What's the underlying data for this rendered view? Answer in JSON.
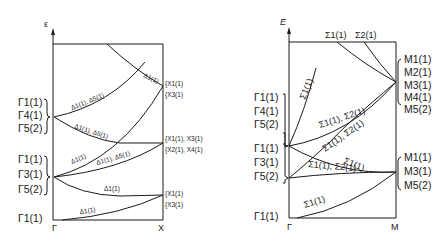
{
  "left_panel": {
    "axis_label": "ε",
    "x_start_label": "Γ",
    "x_end_label": "X",
    "gamma_groups": [
      [
        "Γ1(1)",
        "Γ4(1)",
        "Γ5(2)"
      ],
      [
        "Γ1(1)",
        "Γ3(1)",
        "Γ5(2)"
      ],
      [
        "Γ1(1)"
      ]
    ],
    "x_groups": [
      [
        "{X1(1)",
        "{X3(1)"
      ],
      [
        "{X1(1), X3(1)",
        "{X2(1), X4(1)"
      ],
      [
        "{X1(1)",
        "{X3(1)"
      ]
    ],
    "branch_labels": {
      "top_right": "Δ1(1)",
      "upper_rising": "Δ1(1), Δ5(1)",
      "mid_falling": "Δ1(1), Δ5(1)",
      "mid_rising_a": "Δ1(1)",
      "mid_rising_b": "Δ1(1), Δ5(1)",
      "lower_falling": "Δ1(1)",
      "bottom": "Δ1(1)"
    }
  },
  "right_panel": {
    "axis_label": "E",
    "x_start_label": "Γ",
    "x_end_label": "M",
    "top_labels": [
      "Σ1(1)",
      "Σ2(1)"
    ],
    "gamma_groups": [
      [
        "Γ1(1)",
        "Γ4(1)",
        "Γ5(2)"
      ],
      [
        "Γ1(1)",
        "Γ3(1)",
        "Γ5(2)"
      ],
      [
        "Γ1(1)"
      ]
    ],
    "m_groups": [
      [
        "M1(1)",
        "M2(1)",
        "M3(1)",
        "M4(1)",
        "M5(2)"
      ],
      [
        "M1(1)",
        "M3(1)",
        "M5(2)"
      ]
    ],
    "branch_labels": {
      "upper_short": "Σ1(1)",
      "upper_to_m": "Σ1(1), Σ2(1)",
      "upper_falling": "Σ1(1), Σ2(1)",
      "cross": "Σ1(1)",
      "mid_to_m": "Σ1(1), Σ2(1)",
      "bottom": "Σ1(1)"
    }
  }
}
